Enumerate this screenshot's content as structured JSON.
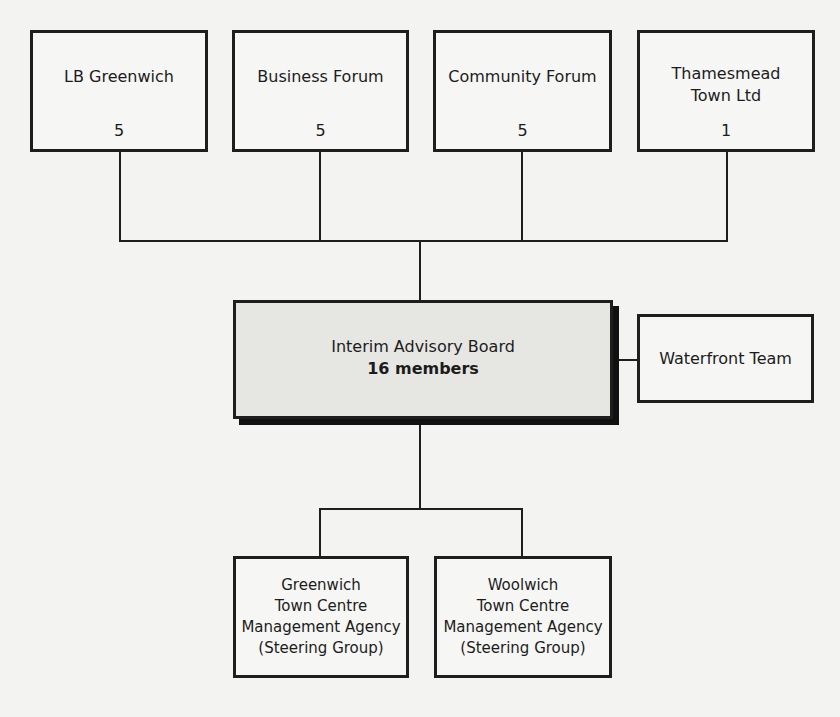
{
  "diagram": {
    "type": "organisation-chart",
    "top_bodies": [
      {
        "name": "LB Greenwich",
        "members": "5"
      },
      {
        "name": "Business Forum",
        "members": "5"
      },
      {
        "name": "Community Forum",
        "members": "5"
      },
      {
        "name": "Thamesmead\nTown Ltd",
        "members": "1"
      }
    ],
    "central": {
      "title": "Interim Advisory Board",
      "members": "16 members"
    },
    "side": {
      "name": "Waterfront Team"
    },
    "sub_bodies": [
      {
        "name": "Greenwich\nTown Centre\nManagement Agency\n(Steering Group)"
      },
      {
        "name": "Woolwich\nTown Centre\nManagement Agency\n(Steering Group)"
      }
    ]
  }
}
